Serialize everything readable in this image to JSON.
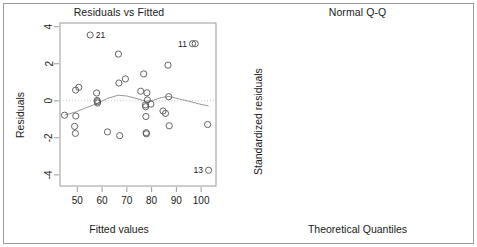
{
  "figure": {
    "background": "#ffffff",
    "frame_color": "#9a9a9a",
    "point_color": "#555555",
    "line_color": "#999999"
  },
  "chart_data": [
    {
      "type": "scatter",
      "title": "Residuals vs Fitted",
      "xlabel": "Fitted values",
      "ylabel": "Residuals",
      "xlim": [
        43,
        106
      ],
      "ylim": [
        -4.6,
        4.2
      ],
      "xticks": [
        50,
        60,
        70,
        80,
        90,
        100
      ],
      "yticks": [
        4,
        2,
        0,
        -2,
        -4
      ],
      "grid": false,
      "legend": "none",
      "x": [
        44.8,
        48.9,
        49.2,
        49.3,
        49.4,
        50.6,
        55.2,
        57.8,
        58.0,
        58.1,
        58.2,
        62.2,
        66.6,
        66.8,
        67.1,
        69.4,
        75.6,
        76.8,
        77.5,
        77.6,
        77.7,
        77.8,
        77.9,
        78.1,
        78.3,
        79.7,
        84.6,
        85.6,
        86.6,
        86.9,
        87.1,
        96.5,
        97.6,
        102.6,
        103.0
      ],
      "y": [
        -0.78,
        -1.38,
        -1.76,
        0.58,
        -0.82,
        0.73,
        3.55,
        0.42,
        0.02,
        -0.05,
        -0.12,
        -1.68,
        2.52,
        0.96,
        -1.88,
        1.18,
        0.52,
        1.45,
        -0.22,
        -0.32,
        -0.85,
        -1.72,
        -1.78,
        0.43,
        0.05,
        -0.18,
        -0.55,
        -0.68,
        1.92,
        0.22,
        -1.35,
        3.08,
        3.08,
        -1.28,
        -3.75
      ],
      "point_labels": [
        {
          "text": "21",
          "x": 55.2,
          "y": 3.55,
          "side": "right"
        },
        {
          "text": "11",
          "x": 96.5,
          "y": 3.08,
          "side": "left"
        },
        {
          "text": "13",
          "x": 103.0,
          "y": -3.75,
          "side": "left"
        }
      ],
      "smoother": {
        "description": "lowess smoothing curve",
        "x": [
          44.8,
          49.0,
          53.0,
          57.5,
          62.0,
          66.5,
          70.0,
          74.0,
          77.5,
          81.0,
          84.0,
          87.0,
          91.0,
          95.0,
          99.0,
          103.0
        ],
        "y": [
          -0.78,
          -0.62,
          -0.4,
          -0.18,
          0.12,
          0.3,
          0.26,
          0.12,
          -0.02,
          0.04,
          0.18,
          0.24,
          0.1,
          -0.02,
          -0.16,
          -0.28
        ]
      },
      "reference_line": {
        "type": "horizontal-dotted",
        "y": 0
      }
    },
    {
      "type": "scatter",
      "title": "Normal Q-Q",
      "xlabel": "Theoretical Quantiles",
      "ylabel": "Standardized residuals",
      "xlim": [
        -2.35,
        2.35
      ],
      "ylim": [
        -2.65,
        2.55
      ],
      "xticks": [
        -2,
        -1,
        0,
        1,
        2
      ],
      "yticks": [
        2,
        1,
        0,
        -1,
        -2
      ],
      "grid": false,
      "legend": "none",
      "x": [
        -2.12,
        -1.66,
        -1.42,
        -1.26,
        -1.14,
        -1.04,
        -0.94,
        -0.86,
        -0.78,
        -0.7,
        -0.62,
        -0.55,
        -0.48,
        -0.42,
        -0.35,
        -0.29,
        -0.23,
        -0.17,
        -0.11,
        -0.05,
        0.01,
        0.07,
        0.13,
        0.19,
        0.25,
        0.32,
        0.38,
        0.45,
        0.52,
        0.6,
        0.68,
        0.77,
        0.87,
        0.98,
        1.11,
        1.25,
        1.42,
        1.5,
        1.64,
        2.1
      ],
      "y": [
        -2.42,
        -1.22,
        -1.02,
        -0.98,
        -0.95,
        -0.92,
        -0.88,
        -0.86,
        -0.84,
        -0.82,
        -0.8,
        -0.52,
        -0.5,
        -0.47,
        -0.44,
        -0.36,
        -0.3,
        -0.22,
        -0.15,
        -0.07,
        0.02,
        0.1,
        0.18,
        0.26,
        0.32,
        0.38,
        0.44,
        0.5,
        0.56,
        0.62,
        0.7,
        0.78,
        0.88,
        1.12,
        1.52,
        1.9,
        1.92,
        1.92,
        1.92,
        2.12
      ],
      "point_labels": [
        {
          "text": "13",
          "x": -2.12,
          "y": -2.42,
          "side": "right"
        },
        {
          "text": "21",
          "x": 2.1,
          "y": 2.12,
          "side": "left"
        },
        {
          "text": "20",
          "x": 1.64,
          "y": 1.92,
          "side": "left"
        }
      ],
      "reference_line": {
        "type": "diagonal-dotted",
        "from": [
          -2.3,
          -2.45
        ],
        "to": [
          2.3,
          2.35
        ]
      }
    }
  ]
}
